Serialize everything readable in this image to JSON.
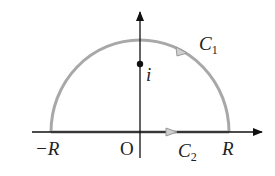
{
  "diagram": {
    "type": "contour-integral-semicircle",
    "labels": {
      "upper_arc": {
        "name": "C",
        "sub": "1"
      },
      "real_segment": {
        "name": "C",
        "sub": "2"
      },
      "left_endpoint": "−R",
      "right_endpoint": "R",
      "origin": "O",
      "pole": "i"
    },
    "colors": {
      "axes": "#111111",
      "contour": "#a8a8a8",
      "background": "#ffffff"
    }
  }
}
